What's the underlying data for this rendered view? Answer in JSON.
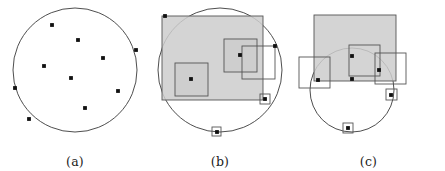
{
  "figure": {
    "background_color": "#ffffff",
    "stroke_color": "#2b2b2b",
    "point_color": "#111111",
    "box_fill_color": "#cccccc",
    "box_fill_opacity": 0.85,
    "box_stroke_color": "#555555",
    "circle_stroke_color": "#3a3a3a",
    "panel_count": 3
  },
  "panels": [
    {
      "id": "a",
      "caption": "(a)",
      "description": "circle with scattered points",
      "circle": {
        "cx": 75,
        "cy": 70,
        "r": 62
      },
      "points": [
        {
          "x": 52,
          "y": 25
        },
        {
          "x": 78,
          "y": 40
        },
        {
          "x": 103,
          "y": 58
        },
        {
          "x": 44,
          "y": 66
        },
        {
          "x": 71,
          "y": 78
        },
        {
          "x": 118,
          "y": 91
        },
        {
          "x": 85,
          "y": 108
        },
        {
          "x": 15,
          "y": 88
        },
        {
          "x": 29,
          "y": 119
        },
        {
          "x": 136,
          "y": 50
        }
      ],
      "boxes": []
    },
    {
      "id": "b",
      "caption": "(b)",
      "description": "circle with large and small axis-aligned squares covering points",
      "circle": {
        "cx": 75,
        "cy": 70,
        "r": 62
      },
      "points": [
        {
          "x": 20,
          "y": 16
        },
        {
          "x": 95,
          "y": 55
        },
        {
          "x": 46,
          "y": 79
        },
        {
          "x": 130,
          "y": 46
        },
        {
          "x": 120,
          "y": 99
        },
        {
          "x": 72,
          "y": 132
        }
      ],
      "boxes": [
        {
          "x": 17,
          "y": 16,
          "w": 101,
          "h": 84,
          "filled": true,
          "label": "large-box"
        },
        {
          "x": 30,
          "y": 63,
          "w": 33,
          "h": 33,
          "filled": true,
          "label": "medium-box-left"
        },
        {
          "x": 79,
          "y": 39,
          "w": 33,
          "h": 33,
          "filled": true,
          "label": "medium-box-center"
        },
        {
          "x": 97,
          "y": 46,
          "w": 33,
          "h": 33,
          "filled": false,
          "label": "medium-box-right"
        },
        {
          "x": 115,
          "y": 94,
          "w": 10,
          "h": 10,
          "filled": false,
          "label": "small-box-right"
        },
        {
          "x": 67,
          "y": 127,
          "w": 9,
          "h": 9,
          "filled": false,
          "label": "small-box-bottom"
        }
      ]
    },
    {
      "id": "c",
      "caption": "(c)",
      "description": "shifted circle overlapped by squares, points on arc",
      "circle": {
        "cx": 60,
        "cy": 90,
        "r": 42
      },
      "points": [
        {
          "x": 60,
          "y": 56
        },
        {
          "x": 26,
          "y": 80
        },
        {
          "x": 60,
          "y": 79
        },
        {
          "x": 87,
          "y": 70
        },
        {
          "x": 99,
          "y": 95
        },
        {
          "x": 56,
          "y": 128
        }
      ],
      "boxes": [
        {
          "x": 22,
          "y": 15,
          "w": 82,
          "h": 66,
          "filled": true,
          "label": "large-box"
        },
        {
          "x": 57,
          "y": 45,
          "w": 31,
          "h": 31,
          "filled": false,
          "label": "medium-box-center"
        },
        {
          "x": 83,
          "y": 53,
          "w": 31,
          "h": 31,
          "filled": false,
          "label": "medium-box-right"
        },
        {
          "x": 7,
          "y": 57,
          "w": 31,
          "h": 31,
          "filled": false,
          "label": "medium-box-left"
        },
        {
          "x": 94,
          "y": 89,
          "w": 11,
          "h": 11,
          "filled": false,
          "label": "small-box-right"
        },
        {
          "x": 51,
          "y": 123,
          "w": 10,
          "h": 10,
          "filled": false,
          "label": "small-box-bottom"
        }
      ]
    }
  ]
}
